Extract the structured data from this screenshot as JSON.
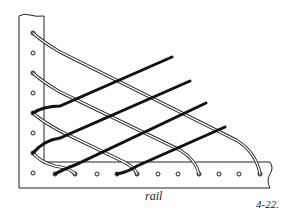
{
  "figure": {
    "labels": {
      "rail": "rail",
      "figure_number": "4-22."
    },
    "colors": {
      "line": "#222222",
      "background": "#ffffff",
      "dark_strand": "#111111"
    },
    "post": {
      "hole_count": 8,
      "holes_y": [
        33,
        53,
        73,
        93,
        113,
        133,
        153,
        173
      ]
    },
    "rail": {
      "hole_count": 11,
      "holes_x": [
        55,
        75,
        97,
        117,
        137,
        158,
        178,
        199,
        219,
        239,
        260
      ]
    },
    "light_strands": [
      {
        "from": "post-hole-1",
        "to": "rail-hole-11"
      },
      {
        "from": "post-hole-3",
        "to": "rail-hole-8"
      },
      {
        "from": "post-hole-5",
        "to": "rail-hole-5"
      },
      {
        "from": "post-hole-7",
        "to": "rail-hole-2"
      }
    ],
    "dark_strands": [
      {
        "from": "post-hole-5"
      },
      {
        "from": "post-hole-7"
      },
      {
        "from": "rail-hole-1"
      },
      {
        "from": "rail-hole-4"
      }
    ]
  }
}
